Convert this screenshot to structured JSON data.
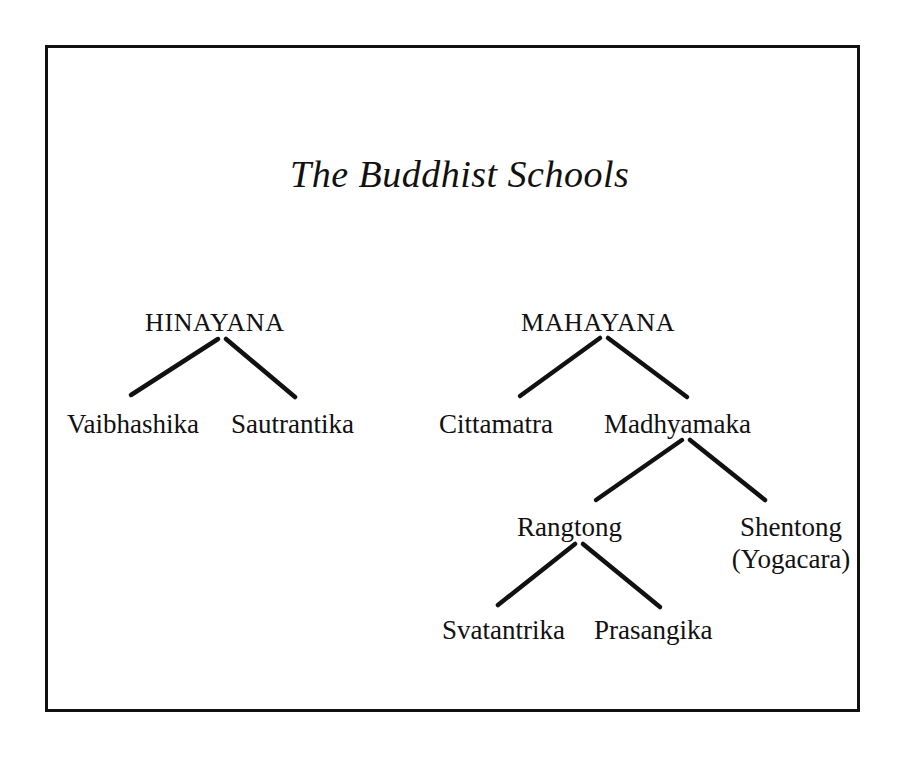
{
  "diagram": {
    "title": "The Buddhist Schools",
    "type": "tree",
    "background_color": "#ffffff",
    "ink_color": "#111111",
    "border_color": "#111111",
    "nodes": [
      {
        "id": "hinayana",
        "label": "HINAYANA",
        "style": "uppercase"
      },
      {
        "id": "vaibhashika",
        "label": "Vaibhashika",
        "style": "normal"
      },
      {
        "id": "sautrantika",
        "label": "Sautrantika",
        "style": "normal"
      },
      {
        "id": "mahayana",
        "label": "MAHAYANA",
        "style": "uppercase"
      },
      {
        "id": "cittamatra",
        "label": "Cittamatra",
        "style": "normal"
      },
      {
        "id": "madhyamaka",
        "label": "Madhyamaka",
        "style": "normal"
      },
      {
        "id": "rangtong",
        "label": "Rangtong",
        "style": "normal"
      },
      {
        "id": "shentong",
        "label": "Shentong",
        "label_line2": "(Yogacara)",
        "style": "normal"
      },
      {
        "id": "svatantrika",
        "label": "Svatantrika",
        "style": "normal"
      },
      {
        "id": "prasangika",
        "label": "Prasangika",
        "style": "normal"
      }
    ],
    "edges": [
      {
        "from": "hinayana",
        "to": "vaibhashika"
      },
      {
        "from": "hinayana",
        "to": "sautrantika"
      },
      {
        "from": "mahayana",
        "to": "cittamatra"
      },
      {
        "from": "mahayana",
        "to": "madhyamaka"
      },
      {
        "from": "madhyamaka",
        "to": "rangtong"
      },
      {
        "from": "madhyamaka",
        "to": "shentong"
      },
      {
        "from": "rangtong",
        "to": "svatantrika"
      },
      {
        "from": "rangtong",
        "to": "prasangika"
      }
    ]
  }
}
